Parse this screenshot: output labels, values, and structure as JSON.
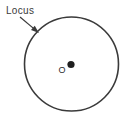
{
  "figure": {
    "type": "geometry-diagram",
    "background_color": "#ffffff",
    "stroke_color": "#3a3a3a",
    "labels": {
      "locus": "Locus",
      "center_point": "O"
    },
    "shapes": {
      "circle": {
        "name": "locus-circle",
        "center_x": 71.5,
        "center_y": 64,
        "radius": 47,
        "stroke_width": 1.6,
        "fill": "none"
      },
      "center_dot": {
        "name": "center-point-dot",
        "center_x": 71,
        "center_y": 64.5,
        "radius": 3.6,
        "fill": "#1f1f1f"
      },
      "arrow": {
        "name": "locus-arrow",
        "start_x": 20,
        "start_y": 17,
        "end_x": 39,
        "end_y": 33,
        "stroke_width": 1.2
      }
    },
    "label_positions": {
      "locus": {
        "x": 6,
        "y": 14
      },
      "center_point": {
        "x": 62,
        "y": 73
      }
    }
  }
}
